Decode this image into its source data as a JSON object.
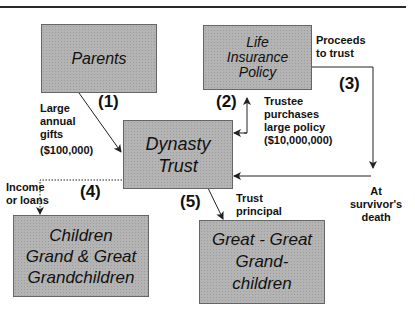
{
  "boxes": {
    "parents": {
      "lines": [
        "Parents"
      ]
    },
    "life_insurance": {
      "lines": [
        "Life",
        "Insurance",
        "Policy"
      ]
    },
    "dynasty_trust": {
      "lines": [
        "Dynasty",
        "Trust"
      ]
    },
    "children": {
      "lines": [
        "Children",
        "Grand & Great",
        "Grandchildren"
      ]
    },
    "great_great": {
      "lines": [
        "Great - Great",
        "Grand-",
        "children"
      ]
    }
  },
  "steps": {
    "s1": "(1)",
    "s2": "(2)",
    "s3": "(3)",
    "s4": "(4)",
    "s5": "(5)"
  },
  "labels": {
    "gifts": [
      "Large",
      "annual",
      "gifts",
      "($100,000)"
    ],
    "trustee": [
      "Trustee",
      "purchases",
      "large policy",
      "($10,000,000)"
    ],
    "proceeds": [
      "Proceeds",
      "to trust"
    ],
    "survivor": [
      "At",
      "survivor's",
      "death"
    ],
    "income": [
      "Income",
      "or loans"
    ],
    "principal": [
      "Trust",
      "principal"
    ]
  },
  "colors": {
    "box_fill": "#b4b4b4",
    "line": "#222222"
  }
}
